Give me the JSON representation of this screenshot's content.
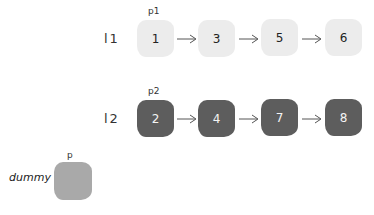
{
  "diagram": {
    "type": "linked-list-merge",
    "lists": [
      {
        "label": "l1",
        "pointer": "p1",
        "style": "light",
        "color": "#ececec",
        "nodes": [
          "1",
          "3",
          "5",
          "6"
        ]
      },
      {
        "label": "l2",
        "pointer": "p2",
        "style": "dark",
        "color": "#5d5d5d",
        "nodes": [
          "2",
          "4",
          "7",
          "8"
        ]
      }
    ],
    "dummy": {
      "label": "dummy",
      "pointer": "p",
      "color": "#a9a9a9"
    },
    "arrow_glyph": "→"
  }
}
